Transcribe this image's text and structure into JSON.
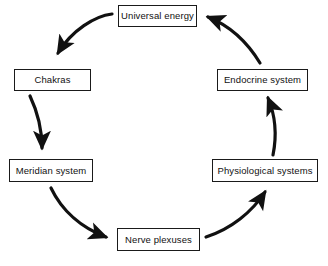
{
  "diagram": {
    "type": "cycle",
    "title": "",
    "background_color": "#ffffff",
    "node_border_color": "#1a1a1a",
    "arrow_color": "#111111",
    "flow_direction": "clockwise",
    "nodes": [
      {
        "id": "universal-energy",
        "label": "Universal energy",
        "position": "top"
      },
      {
        "id": "endocrine-system",
        "label": "Endocrine system",
        "position": "right-upper"
      },
      {
        "id": "physiological",
        "label": "Physiological systems",
        "position": "right-lower"
      },
      {
        "id": "nerve-plexuses",
        "label": "Nerve plexuses",
        "position": "bottom"
      },
      {
        "id": "meridian-system",
        "label": "Meridian system",
        "position": "left-lower"
      },
      {
        "id": "chakras",
        "label": "Chakras",
        "position": "left-upper"
      }
    ],
    "edges": [
      {
        "id": "edge-universal-to-chakras",
        "from": "universal-energy",
        "to": "chakras",
        "style": "curved-arrow"
      },
      {
        "id": "edge-chakras-to-meridian",
        "from": "chakras",
        "to": "meridian-system",
        "style": "curved-arrow"
      },
      {
        "id": "edge-meridian-to-nerve",
        "from": "meridian-system",
        "to": "nerve-plexuses",
        "style": "curved-arrow"
      },
      {
        "id": "edge-nerve-to-physiological",
        "from": "nerve-plexuses",
        "to": "physiological",
        "style": "curved-arrow"
      },
      {
        "id": "edge-physiological-to-endocrine",
        "from": "physiological",
        "to": "endocrine-system",
        "style": "curved-arrow"
      },
      {
        "id": "edge-endocrine-to-universal",
        "from": "endocrine-system",
        "to": "universal-energy",
        "style": "curved-arrow"
      }
    ]
  }
}
